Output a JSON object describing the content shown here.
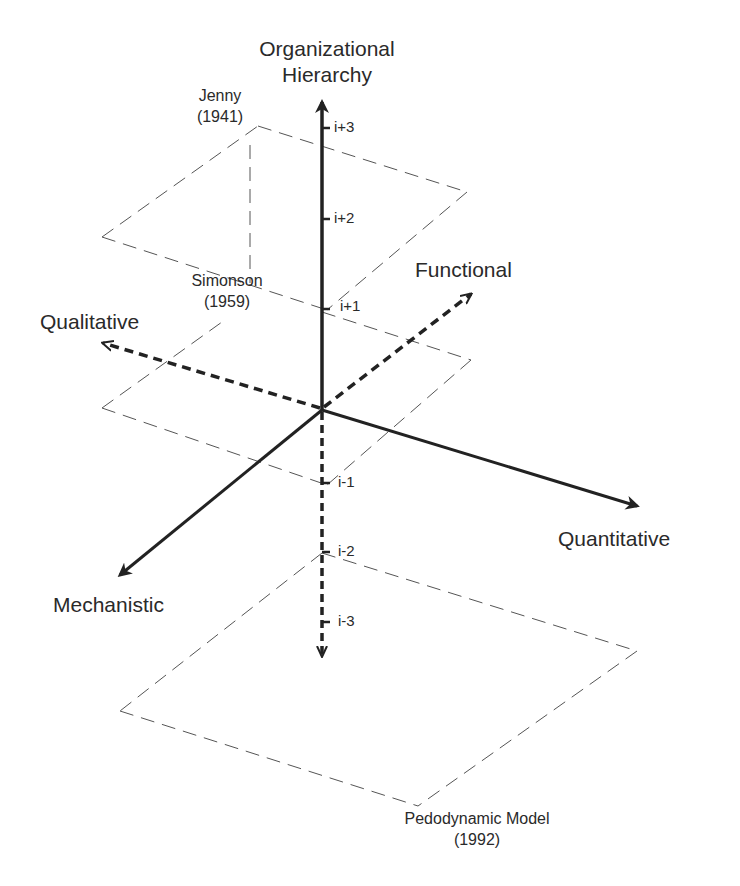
{
  "diagram": {
    "axes": {
      "vertical": {
        "label_line1": "Organizational",
        "label_line2": "Hierarchy"
      },
      "functional": {
        "label": "Functional"
      },
      "qualitative": {
        "label": "Qualitative"
      },
      "quantitative": {
        "label": "Quantitative"
      },
      "mechanistic": {
        "label": "Mechanistic"
      }
    },
    "ticks": [
      "i+3",
      "i+2",
      "i+1",
      "i-1",
      "i-2",
      "i-3"
    ],
    "models": [
      {
        "name": "Jenny",
        "year": "(1941)"
      },
      {
        "name": "Simonson",
        "year": "(1959)"
      },
      {
        "name": "Pedodynamic Model",
        "year": "(1992)"
      }
    ],
    "colors": {
      "line": "#222222",
      "dashed_plane": "#555555",
      "background": "#ffffff"
    }
  }
}
